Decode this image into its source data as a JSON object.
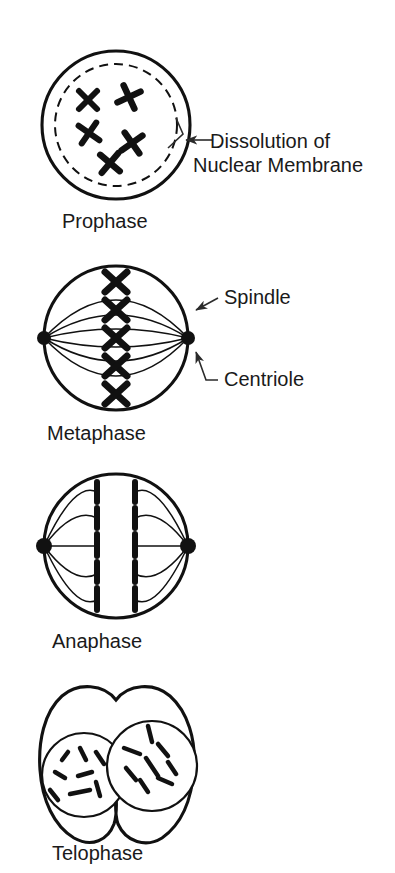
{
  "figure": {
    "background_color": "#ffffff",
    "ink_color": "#111111"
  },
  "phases": [
    {
      "id": "prophase",
      "caption": "Prophase",
      "caption_x": 62,
      "caption_y": 228,
      "cell": {
        "cx": 116,
        "cy": 125,
        "r": 74
      },
      "nuclear_membrane": {
        "cx": 116,
        "cy": 125,
        "r": 61,
        "style": "dashed"
      },
      "chromosome_shape": "x-shaped",
      "chromosome_count": 5,
      "chromosomes": [
        {
          "x": 88,
          "y": 100,
          "rot": 0
        },
        {
          "x": 129,
          "y": 97,
          "rot": 20
        },
        {
          "x": 89,
          "y": 133,
          "rot": -10
        },
        {
          "x": 132,
          "y": 143,
          "rot": 10
        },
        {
          "x": 110,
          "y": 163,
          "rot": -5
        }
      ]
    },
    {
      "id": "metaphase",
      "caption": "Metaphase",
      "caption_x": 47,
      "caption_y": 440,
      "cell": {
        "cx": 116,
        "cy": 338,
        "r": 72
      },
      "centrioles": [
        {
          "cx": 44,
          "cy": 338,
          "r": 7
        },
        {
          "cx": 188,
          "cy": 338,
          "r": 7
        }
      ],
      "chromosome_shape": "x-shaped",
      "chromosome_count": 5,
      "chromosomes": [
        {
          "x": 116,
          "y": 282,
          "rot": 0
        },
        {
          "x": 116,
          "y": 310,
          "rot": 0
        },
        {
          "x": 116,
          "y": 338,
          "rot": 0
        },
        {
          "x": 116,
          "y": 366,
          "rot": 0
        },
        {
          "x": 116,
          "y": 394,
          "rot": 0
        }
      ]
    },
    {
      "id": "anaphase",
      "caption": "Anaphase",
      "caption_x": 52,
      "caption_y": 648,
      "cell": {
        "cx": 116,
        "cy": 546,
        "r": 72
      },
      "centrioles": [
        {
          "cx": 44,
          "cy": 546,
          "r": 8
        },
        {
          "cx": 188,
          "cy": 546,
          "r": 8
        }
      ],
      "chromosome_shape": "separated-chromatid-rods",
      "chromatid_columns": [
        {
          "x": 97,
          "count": 5
        },
        {
          "x": 135,
          "count": 5
        }
      ],
      "chromatid_rows_y": [
        494,
        520,
        546,
        572,
        598
      ]
    },
    {
      "id": "telophase",
      "caption": "Telophase",
      "caption_x": 52,
      "caption_y": 860,
      "cell_shape": "pinched-dumbbell",
      "daughter_nuclei": [
        {
          "cx": 84,
          "cy": 775,
          "r": 42
        },
        {
          "cx": 152,
          "cy": 766,
          "r": 45
        }
      ],
      "chromosome_shape": "short-curved-threads",
      "threads_left": [
        {
          "x1": 62,
          "y1": 760,
          "x2": 68,
          "y2": 752
        },
        {
          "x1": 80,
          "y1": 748,
          "x2": 86,
          "y2": 760
        },
        {
          "x1": 96,
          "y1": 752,
          "x2": 104,
          "y2": 764
        },
        {
          "x1": 55,
          "y1": 772,
          "x2": 65,
          "y2": 778
        },
        {
          "x1": 78,
          "y1": 776,
          "x2": 92,
          "y2": 772
        },
        {
          "x1": 50,
          "y1": 790,
          "x2": 58,
          "y2": 800
        },
        {
          "x1": 70,
          "y1": 794,
          "x2": 90,
          "y2": 790
        },
        {
          "x1": 96,
          "y1": 782,
          "x2": 100,
          "y2": 796
        },
        {
          "x1": 86,
          "y1": 798,
          "x2": 100,
          "y2": 796
        }
      ],
      "threads_right": [
        {
          "x1": 148,
          "y1": 726,
          "x2": 152,
          "y2": 742
        },
        {
          "x1": 124,
          "y1": 748,
          "x2": 140,
          "y2": 754
        },
        {
          "x1": 158,
          "y1": 744,
          "x2": 168,
          "y2": 756
        },
        {
          "x1": 126,
          "y1": 768,
          "x2": 136,
          "y2": 780
        },
        {
          "x1": 146,
          "y1": 758,
          "x2": 158,
          "y2": 776
        },
        {
          "x1": 168,
          "y1": 762,
          "x2": 176,
          "y2": 774
        },
        {
          "x1": 140,
          "y1": 780,
          "x2": 148,
          "y2": 792
        },
        {
          "x1": 158,
          "y1": 778,
          "x2": 172,
          "y2": 784
        },
        {
          "x1": 128,
          "y1": 786,
          "x2": 134,
          "y2": 792
        }
      ]
    }
  ],
  "annotations": [
    {
      "id": "dissolution-label",
      "line1": "Dissolution of",
      "line2": "Nuclear Membrane",
      "text_x": 210,
      "text_y1": 148,
      "text_y2": 172,
      "points_to": "nuclear-membrane-dashed",
      "has_arrowhead": true
    },
    {
      "id": "spindle-label",
      "line1": "Spindle",
      "text_x": 224,
      "text_y1": 304,
      "points_to": "spindle-fiber",
      "has_arrowhead": true
    },
    {
      "id": "centriole-label",
      "line1": "Centriole",
      "text_x": 224,
      "text_y1": 386,
      "points_to": "centriole-dot",
      "has_arrowhead": true
    }
  ]
}
